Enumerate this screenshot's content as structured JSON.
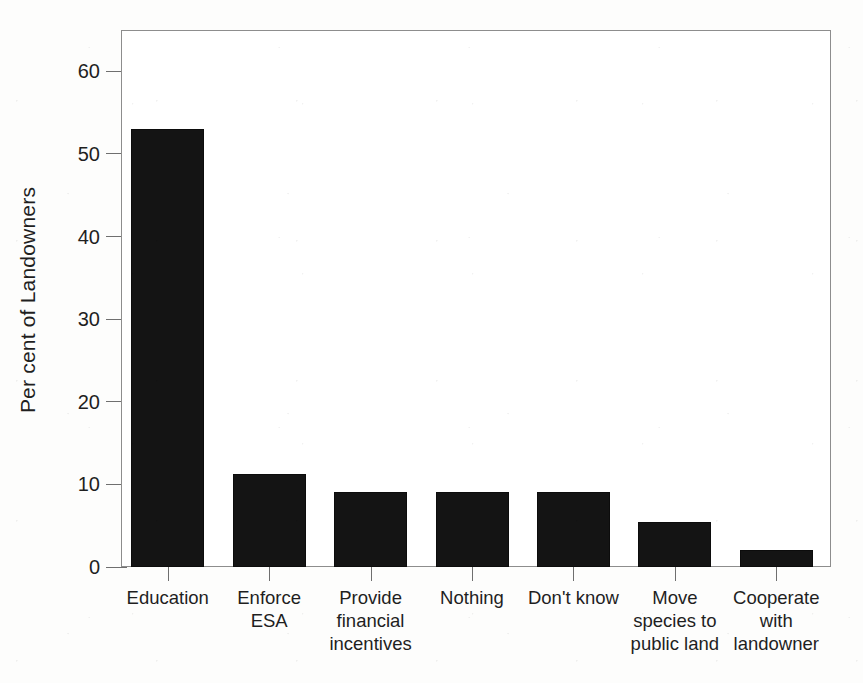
{
  "chart_data": {
    "type": "bar",
    "title": "",
    "xlabel": "",
    "ylabel": "Per cent of Landowners",
    "ylim": [
      0,
      65
    ],
    "yticks": [
      0,
      10,
      20,
      30,
      40,
      50,
      60
    ],
    "ytick_labels": [
      "0",
      "10",
      "20",
      "30",
      "40",
      "50",
      "60"
    ],
    "grid": false,
    "legend": false,
    "bar_color": "#141414",
    "frame_color": "#8d8d8d",
    "categories": [
      "Education",
      "Enforce ESA",
      "Provide financial incentives",
      "Nothing",
      "Don't know",
      "Move species to public land",
      "Cooperate with landowner"
    ],
    "category_lines": [
      [
        "Education"
      ],
      [
        "Enforce",
        "ESA"
      ],
      [
        "Provide",
        "financial",
        "incentives"
      ],
      [
        "Nothing"
      ],
      [
        "Don't know"
      ],
      [
        "Move",
        "species to",
        "public land"
      ],
      [
        "Cooperate",
        "with",
        "landowner"
      ]
    ],
    "values": [
      53.0,
      11.3,
      9.1,
      9.1,
      9.1,
      5.4,
      2.1
    ]
  }
}
